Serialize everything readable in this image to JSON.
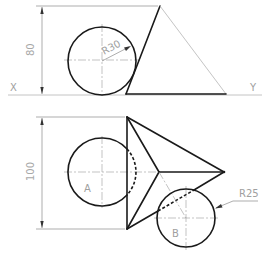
{
  "labels": {
    "x_axis": "X",
    "y_axis": "Y",
    "dim_front_height": "80",
    "dim_top_height": "100",
    "radius_front": "R30",
    "radius_b": "R25",
    "circle_a": "A",
    "circle_b": "B"
  },
  "colors": {
    "outline": "#1a1a1a",
    "construction": "#8a8a8a",
    "text": "#a0a0a0",
    "background": "#ffffff"
  }
}
